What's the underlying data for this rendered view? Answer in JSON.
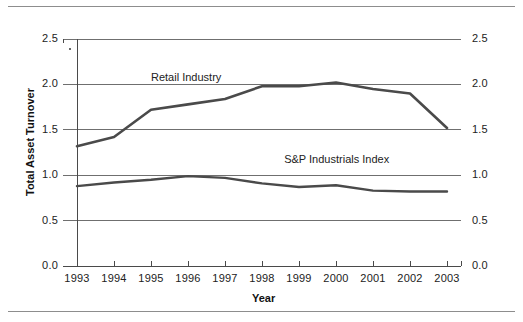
{
  "chart_data": {
    "type": "line",
    "title": "",
    "xlabel": "Year",
    "ylabel": "Total Asset Turnover",
    "categories": [
      "1993",
      "1994",
      "1995",
      "1996",
      "1997",
      "1998",
      "1999",
      "2000",
      "2001",
      "2002",
      "2003"
    ],
    "x": [
      1993,
      1994,
      1995,
      1996,
      1997,
      1998,
      1999,
      2000,
      2001,
      2002,
      2003
    ],
    "ylim": [
      0.0,
      2.5
    ],
    "yticks": [
      "0.0",
      "0.5",
      "1.0",
      "1.5",
      "2.0",
      "2.5"
    ],
    "ytick_values": [
      0.0,
      0.5,
      1.0,
      1.5,
      2.0,
      2.5
    ],
    "right_axis": true,
    "right_yticks": [
      "0.0",
      "0.5",
      "1.0",
      "1.5",
      "2.0",
      "2.5"
    ],
    "grid": true,
    "grid_axis": "y",
    "legend": "inline-labels",
    "series": [
      {
        "name": "Retail Industry",
        "color": "#4a4a4a",
        "values": [
          1.32,
          1.42,
          1.72,
          1.78,
          1.84,
          1.98,
          1.98,
          2.02,
          1.95,
          1.9,
          1.52
        ],
        "label_x": 1995.0,
        "label_y": 2.07
      },
      {
        "name": "S&P Industrials Index",
        "color": "#4a4a4a",
        "values": [
          0.88,
          0.92,
          0.95,
          0.99,
          0.97,
          0.91,
          0.87,
          0.89,
          0.83,
          0.82,
          0.82
        ],
        "label_x": 1998.6,
        "label_y": 1.17
      }
    ]
  },
  "axes": {
    "x_title": "Year",
    "y_title": "Total Asset Turnover"
  }
}
